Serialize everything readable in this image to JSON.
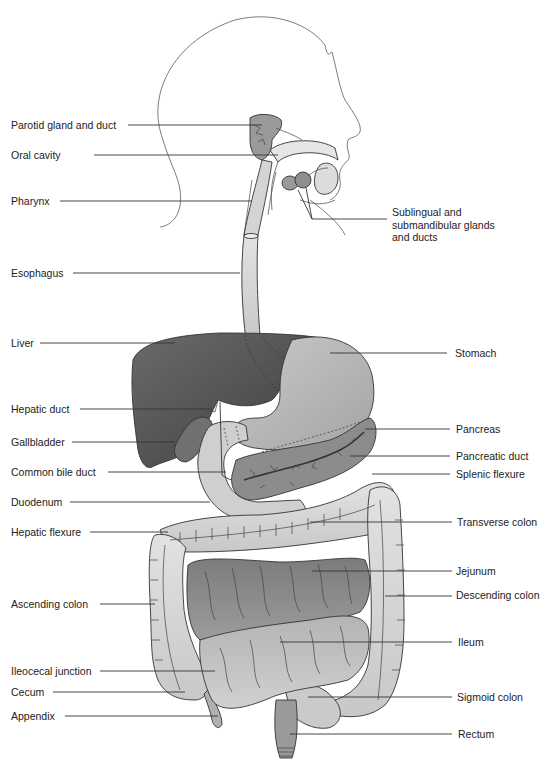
{
  "diagram": {
    "colors": {
      "background": "#ffffff",
      "liver": "#5a5a5a",
      "gallbladder": "#6e6e6e",
      "stomach": "#b8b8b8",
      "pancreas": "#8a8a8a",
      "colon": "#d6d6d6",
      "jejunum": "#8c8c8c",
      "ileum": "#c4c4c4",
      "esophagus": "#c8c8c8",
      "glands": "#9a9a9a",
      "leader_line": "#333333",
      "text": "#222222"
    },
    "labels_left": [
      {
        "id": "parotid",
        "text": "Parotid gland and duct"
      },
      {
        "id": "oral-cavity",
        "text": "Oral cavity"
      },
      {
        "id": "pharynx",
        "text": "Pharynx"
      },
      {
        "id": "esophagus",
        "text": "Esophagus"
      },
      {
        "id": "liver",
        "text": "Liver"
      },
      {
        "id": "hepatic-duct",
        "text": "Hepatic duct"
      },
      {
        "id": "gallbladder",
        "text": "Gallbladder"
      },
      {
        "id": "common-bile-duct",
        "text": "Common bile duct"
      },
      {
        "id": "duodenum",
        "text": "Duodenum"
      },
      {
        "id": "hepatic-flexure",
        "text": "Hepatic flexure"
      },
      {
        "id": "ascending-colon",
        "text": "Ascending colon"
      },
      {
        "id": "ileocecal-junction",
        "text": "Ileocecal junction"
      },
      {
        "id": "cecum",
        "text": "Cecum"
      },
      {
        "id": "appendix",
        "text": "Appendix"
      }
    ],
    "labels_right": [
      {
        "id": "salivary",
        "text": "Sublingual and\nsubmandibular glands\nand ducts"
      },
      {
        "id": "stomach",
        "text": "Stomach"
      },
      {
        "id": "pancreas",
        "text": "Pancreas"
      },
      {
        "id": "pancreatic-duct",
        "text": "Pancreatic duct"
      },
      {
        "id": "splenic-flexure",
        "text": "Splenic flexure"
      },
      {
        "id": "transverse-colon",
        "text": "Transverse colon"
      },
      {
        "id": "jejunum",
        "text": "Jejunum"
      },
      {
        "id": "descending-colon",
        "text": "Descending colon"
      },
      {
        "id": "ileum",
        "text": "Ileum"
      },
      {
        "id": "sigmoid-colon",
        "text": "Sigmoid colon"
      },
      {
        "id": "rectum",
        "text": "Rectum"
      }
    ]
  }
}
